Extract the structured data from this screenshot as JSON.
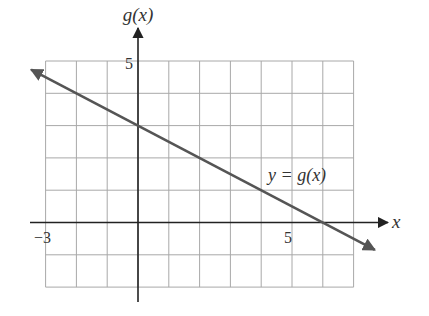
{
  "chart_data": {
    "type": "line",
    "title": "",
    "xlabel": "x",
    "ylabel": "g(x)",
    "xlim": [
      -3,
      7
    ],
    "ylim": [
      -2,
      5
    ],
    "grid": true,
    "x_tick_labels": [
      {
        "value": -3,
        "label": "−3"
      },
      {
        "value": 5,
        "label": "5"
      }
    ],
    "y_tick_labels": [
      {
        "value": 5,
        "label": "5"
      }
    ],
    "series": [
      {
        "name": "y = g(x)",
        "equation": "g(x) = 3 - x/2",
        "slope": -0.5,
        "intercept": 3,
        "x": [
          -3,
          0,
          2,
          4,
          6,
          7
        ],
        "values": [
          4.5,
          3,
          2,
          1,
          0,
          -0.5
        ],
        "arrows_both_ends": true,
        "color": "#555555"
      }
    ],
    "annotations": [
      {
        "text": "y = g(x)",
        "x": 4.3,
        "y": 1.4
      }
    ]
  },
  "labels": {
    "y_axis": "g(x)",
    "x_axis": "x",
    "x_tick_neg3": "−3",
    "x_tick_5": "5",
    "y_tick_5": "5",
    "curve_label": "y = g(x)"
  },
  "colors": {
    "grid": "#a8a8a8",
    "axis": "#222222",
    "line": "#555555",
    "text": "#333333"
  }
}
